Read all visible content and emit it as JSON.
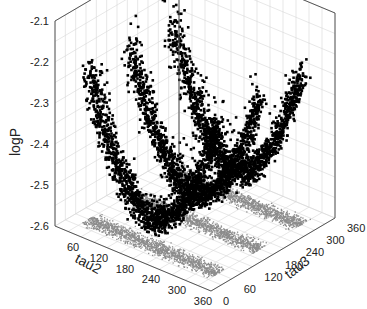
{
  "chart_data": {
    "type": "scatter3d",
    "title": "",
    "xlabel": "tau2",
    "ylabel": "tau3",
    "zlabel": "logP",
    "x_ticks": [
      60,
      120,
      180,
      240,
      300,
      360
    ],
    "y_ticks": [
      0,
      60,
      120,
      180,
      240,
      300,
      360
    ],
    "z_ticks": [
      -2.1,
      -2.2,
      -2.3,
      -2.4,
      -2.5,
      -2.6
    ],
    "xlim": [
      0,
      360
    ],
    "ylim": [
      0,
      360
    ],
    "zlim": [
      -2.6,
      -2.1
    ],
    "grid": true,
    "series": [
      {
        "name": "samples",
        "color": "#000000",
        "marker": "square",
        "description": "~thousands of MCMC samples forming three crescent-shaped clusters along tau3 (~60, ~180, ~300), logP between about -2.55 and -2.17"
      },
      {
        "name": "projection",
        "color": "#8c8c8c",
        "marker": "dot",
        "description": "projection of samples onto the tau2–tau3 floor: three bands at tau3 ≈ 60, 180, 300 spanning tau2 ≈ 30–330"
      }
    ],
    "clusters_tau3": [
      60,
      180,
      300
    ]
  },
  "labels": {
    "x": "tau2",
    "y": "tau3",
    "z": "logP"
  },
  "ticks": {
    "z": [
      "-2.1",
      "-2.2",
      "-2.3",
      "-2.4",
      "-2.5",
      "-2.6"
    ],
    "x": [
      "60",
      "120",
      "180",
      "240",
      "300",
      "360"
    ],
    "y": [
      "0",
      "60",
      "120",
      "180",
      "240",
      "300",
      "360"
    ]
  }
}
